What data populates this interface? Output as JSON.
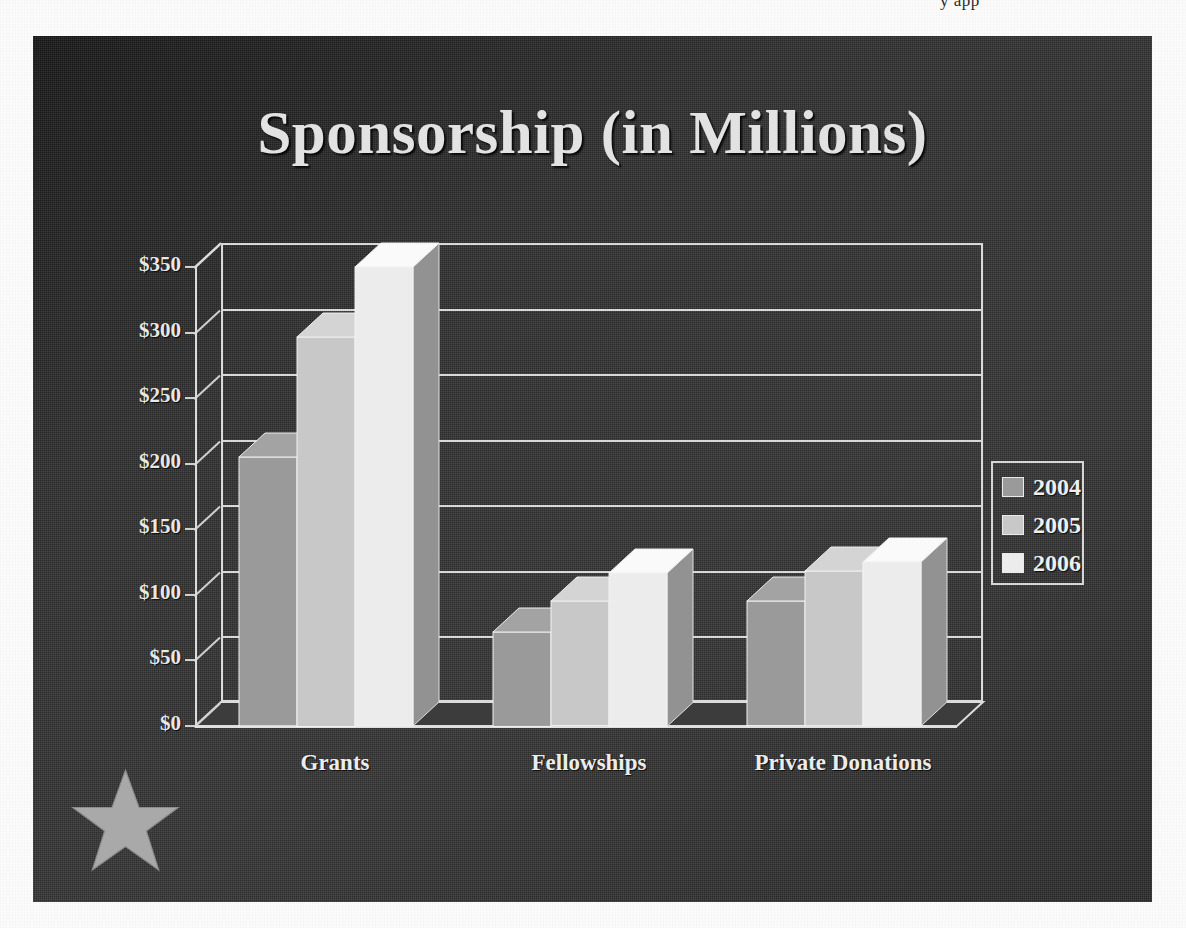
{
  "page": {
    "cropped_header_text": "y app"
  },
  "slide": {
    "title": "Sponsorship (in Millions)",
    "background_color": "#353535",
    "logo": {
      "name": "star-logo",
      "icon": "star-icon",
      "color": "#a9a9a9"
    }
  },
  "chart_data": {
    "type": "bar",
    "title": "Sponsorship (in Millions)",
    "subtitle": "",
    "xlabel": "",
    "ylabel": "",
    "categories": [
      "Grants",
      "Fellowships",
      "Private Donations"
    ],
    "series": [
      {
        "name": "2004",
        "color": "#9a9a9a",
        "values": [
          205,
          72,
          95
        ]
      },
      {
        "name": "2005",
        "color": "#c8c8c8",
        "values": [
          297,
          95,
          118
        ]
      },
      {
        "name": "2006",
        "color": "#ececec",
        "values": [
          350,
          117,
          125
        ]
      }
    ],
    "ylim": [
      0,
      350
    ],
    "ytick_values": [
      0,
      50,
      100,
      150,
      200,
      250,
      300,
      350
    ],
    "ytick_labels": [
      "$0",
      "$50",
      "$100",
      "$150",
      "$200",
      "$250",
      "$300",
      "$350"
    ],
    "grid": true,
    "legend_position": "right",
    "style": "3d-clustered-column",
    "units": "millions of dollars",
    "currency_prefix": "$"
  },
  "legend": {
    "entries": [
      {
        "label": "2004",
        "color": "#9a9a9a"
      },
      {
        "label": "2005",
        "color": "#c8c8c8"
      },
      {
        "label": "2006",
        "color": "#ececec"
      }
    ]
  }
}
